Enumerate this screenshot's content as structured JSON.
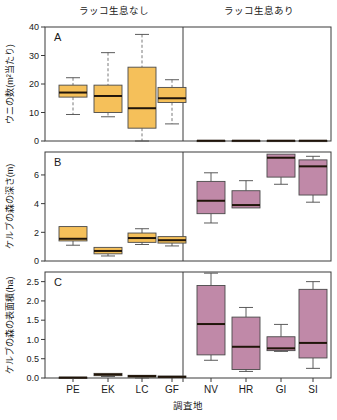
{
  "figure": {
    "headers": {
      "left": "ラッコ生息なし",
      "right": "ラッコ生息あり"
    },
    "xlabel": "調査地",
    "panel_letters": {
      "a": "A",
      "b": "B",
      "c": "C"
    }
  },
  "chart_data": {
    "type": "box",
    "title": "",
    "xlabel": "調査地",
    "grid": false,
    "legend": null,
    "groups": [
      {
        "name": "ラッコ生息なし",
        "sites": [
          "PE",
          "EK",
          "LC",
          "GF"
        ]
      },
      {
        "name": "ラッコ生息あり",
        "sites": [
          "NV",
          "HR",
          "GI",
          "SI"
        ]
      }
    ],
    "categories": [
      "PE",
      "EK",
      "LC",
      "GF",
      "NV",
      "HR",
      "GI",
      "SI"
    ],
    "colors": {
      "no_otter": "#F5C05A",
      "otter": "#C089A8",
      "median": "#20150A",
      "box_edge": "#4A4A4A"
    },
    "panels": [
      {
        "letter": "A",
        "ylabel": "ウニの数(m²当たり)",
        "ylim": [
          0,
          40
        ],
        "yticks": [
          0,
          10,
          20,
          30,
          40
        ],
        "ytick_labels": [
          "0",
          "10",
          "20",
          "30",
          "40"
        ],
        "boxes": [
          {
            "site": "PE",
            "group": "no_otter",
            "lower_whisker": 9.3,
            "q1": 15.4,
            "median": 17.0,
            "q3": 19.6,
            "upper_whisker": 22.2
          },
          {
            "site": "EK",
            "group": "no_otter",
            "lower_whisker": 8.5,
            "q1": 10.0,
            "median": 15.8,
            "q3": 19.6,
            "upper_whisker": 31.0
          },
          {
            "site": "LC",
            "group": "no_otter",
            "lower_whisker": 0.0,
            "q1": 4.5,
            "median": 11.5,
            "q3": 25.9,
            "upper_whisker": 37.4
          },
          {
            "site": "GF",
            "group": "no_otter",
            "lower_whisker": 6.0,
            "q1": 13.5,
            "median": 15.0,
            "q3": 18.8,
            "upper_whisker": 21.5
          },
          {
            "site": "NV",
            "group": "otter",
            "lower_whisker": 0.0,
            "q1": 0.0,
            "median": 0.1,
            "q3": 0.2,
            "upper_whisker": 0.2
          },
          {
            "site": "HR",
            "group": "otter",
            "lower_whisker": 0.0,
            "q1": 0.0,
            "median": 0.1,
            "q3": 0.2,
            "upper_whisker": 0.2
          },
          {
            "site": "GI",
            "group": "otter",
            "lower_whisker": 0.0,
            "q1": 0.0,
            "median": 0.1,
            "q3": 0.2,
            "upper_whisker": 0.2
          },
          {
            "site": "SI",
            "group": "otter",
            "lower_whisker": 0.0,
            "q1": 0.0,
            "median": 0.1,
            "q3": 0.2,
            "upper_whisker": 0.2
          }
        ]
      },
      {
        "letter": "B",
        "ylabel": "ケルプの森の深さ(m)",
        "ylim": [
          0,
          7.6
        ],
        "yticks": [
          0,
          2,
          4,
          6
        ],
        "ytick_labels": [
          "0",
          "2",
          "4",
          "6"
        ],
        "boxes": [
          {
            "site": "PE",
            "group": "no_otter",
            "lower_whisker": 1.1,
            "q1": 1.4,
            "median": 1.55,
            "q3": 2.4,
            "upper_whisker": 2.4
          },
          {
            "site": "EK",
            "group": "no_otter",
            "lower_whisker": 0.35,
            "q1": 0.5,
            "median": 0.7,
            "q3": 0.95,
            "upper_whisker": 0.95
          },
          {
            "site": "LC",
            "group": "no_otter",
            "lower_whisker": 1.15,
            "q1": 1.3,
            "median": 1.6,
            "q3": 1.95,
            "upper_whisker": 2.25
          },
          {
            "site": "GF",
            "group": "no_otter",
            "lower_whisker": 1.05,
            "q1": 1.25,
            "median": 1.45,
            "q3": 1.7,
            "upper_whisker": 1.7
          },
          {
            "site": "NV",
            "group": "otter",
            "lower_whisker": 2.65,
            "q1": 3.3,
            "median": 4.2,
            "q3": 5.55,
            "upper_whisker": 6.15
          },
          {
            "site": "HR",
            "group": "otter",
            "lower_whisker": 3.7,
            "q1": 3.7,
            "median": 3.9,
            "q3": 4.9,
            "upper_whisker": 5.6
          },
          {
            "site": "GI",
            "group": "otter",
            "lower_whisker": 5.35,
            "q1": 5.85,
            "median": 7.2,
            "q3": 7.45,
            "upper_whisker": 7.45
          },
          {
            "site": "SI",
            "group": "otter",
            "lower_whisker": 4.1,
            "q1": 4.6,
            "median": 6.6,
            "q3": 7.05,
            "upper_whisker": 7.3
          }
        ]
      },
      {
        "letter": "C",
        "ylabel": "ケルプの森の表面積(ha)",
        "ylim": [
          0,
          2.75
        ],
        "yticks": [
          0.0,
          0.5,
          1.0,
          1.5,
          2.0,
          2.5
        ],
        "ytick_labels": [
          "0.0",
          "0.5",
          "1.0",
          "1.5",
          "2.0",
          "2.5"
        ],
        "boxes": [
          {
            "site": "PE",
            "group": "no_otter",
            "lower_whisker": 0.0,
            "q1": 0.0,
            "median": 0.01,
            "q3": 0.02,
            "upper_whisker": 0.02
          },
          {
            "site": "EK",
            "group": "no_otter",
            "lower_whisker": 0.04,
            "q1": 0.06,
            "median": 0.09,
            "q3": 0.12,
            "upper_whisker": 0.12
          },
          {
            "site": "LC",
            "group": "no_otter",
            "lower_whisker": 0.0,
            "q1": 0.02,
            "median": 0.05,
            "q3": 0.07,
            "upper_whisker": 0.08
          },
          {
            "site": "GF",
            "group": "no_otter",
            "lower_whisker": 0.0,
            "q1": 0.01,
            "median": 0.03,
            "q3": 0.05,
            "upper_whisker": 0.05
          },
          {
            "site": "NV",
            "group": "otter",
            "lower_whisker": 0.46,
            "q1": 0.6,
            "median": 1.4,
            "q3": 2.4,
            "upper_whisker": 2.72
          },
          {
            "site": "HR",
            "group": "otter",
            "lower_whisker": 0.17,
            "q1": 0.22,
            "median": 0.81,
            "q3": 1.58,
            "upper_whisker": 1.83
          },
          {
            "site": "GI",
            "group": "otter",
            "lower_whisker": 0.69,
            "q1": 0.71,
            "median": 0.77,
            "q3": 1.07,
            "upper_whisker": 1.39
          },
          {
            "site": "SI",
            "group": "otter",
            "lower_whisker": 0.25,
            "q1": 0.52,
            "median": 0.91,
            "q3": 2.3,
            "upper_whisker": 2.5
          }
        ]
      }
    ]
  }
}
